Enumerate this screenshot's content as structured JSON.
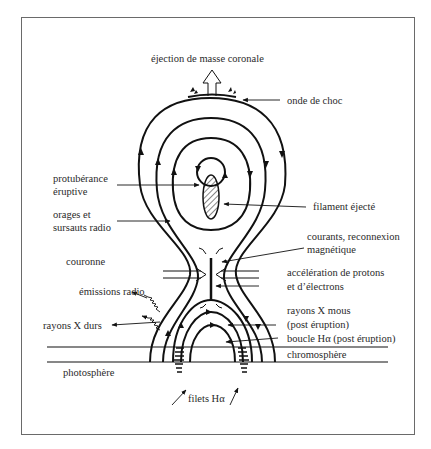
{
  "diagram": {
    "labels": {
      "cme": "éjection de masse coronale",
      "shock": "onde de choc",
      "prominence_1": "protubérance",
      "prominence_2": "éruptive",
      "filament": "filament éjecté",
      "storms_1": "orages et",
      "storms_2": "sursauts radio",
      "currents_1": "courants, reconnexion",
      "currents_2": "magnétique",
      "corona": "couronne",
      "acceleration_1": "accélération de protons",
      "acceleration_2": "et d’électrons",
      "radio": "émissions radio",
      "soft_x_1": "rayons X mous",
      "soft_x_2": "(post éruption)",
      "hard_x": "rayons X durs",
      "halpha_loop": "boucle Hα (post éruption)",
      "chromosphere": "chromosphère",
      "photosphere": "photosphère",
      "halpha_ribbons": "filets Hα"
    },
    "colors": {
      "line": "#111111",
      "text": "#2a2a2a",
      "frame": "#6a6a6a",
      "background": "#ffffff"
    }
  }
}
